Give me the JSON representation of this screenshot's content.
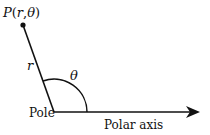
{
  "diagram": {
    "point_label": "P(r,θ)",
    "radius_label": "r",
    "angle_label": "θ",
    "pole_label": "Pole",
    "axis_label": "Polar axis",
    "colors": {
      "stroke": "#111111",
      "background": "#ffffff"
    }
  }
}
